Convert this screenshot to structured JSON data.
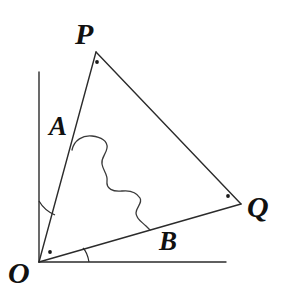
{
  "figure": {
    "background_color": "#ffffff",
    "stroke_color": "#2b2b2b",
    "label_color": "#111111",
    "labels": {
      "P": "P",
      "Q": "Q",
      "O": "O",
      "A": "A",
      "B": "B"
    },
    "points": {
      "O": {
        "x": 39,
        "y": 262
      },
      "P": {
        "x": 96,
        "y": 52
      },
      "Q": {
        "x": 241,
        "y": 204
      },
      "vertical_axis_top": {
        "x": 39,
        "y": 72
      },
      "horizontal_axis_right": {
        "x": 226,
        "y": 262
      }
    },
    "vertex_dots": [
      {
        "name": "dot-near-P",
        "x": 97,
        "y": 62,
        "r": 1.8
      },
      {
        "name": "dot-near-Q",
        "x": 228,
        "y": 196,
        "r": 1.8
      },
      {
        "name": "dot-near-O",
        "x": 50,
        "y": 252,
        "r": 1.8
      }
    ],
    "segments": [
      {
        "name": "vertical-ray",
        "x1": 39,
        "y1": 72,
        "x2": 39,
        "y2": 262
      },
      {
        "name": "horizontal-ray",
        "x1": 39,
        "y1": 262,
        "x2": 226,
        "y2": 262
      },
      {
        "name": "side-OP",
        "x1": 39,
        "y1": 262,
        "x2": 96,
        "y2": 52
      },
      {
        "name": "side-PQ",
        "x1": 96,
        "y1": 52,
        "x2": 241,
        "y2": 204
      },
      {
        "name": "side-OQ",
        "x1": 39,
        "y1": 262,
        "x2": 241,
        "y2": 204
      }
    ],
    "angle_arcs": [
      {
        "name": "angle-arc-A",
        "path": "M 39 203 A 60 60 0 0 0 55 210"
      },
      {
        "name": "angle-arc-B",
        "path": "M 88 262 A 50 50 0 0 0 84 249"
      }
    ],
    "region_curve": {
      "name": "irregular-region-boundary",
      "path": "M 72 150 C 74 141 83 136 92 137 C 100 138 107 141 107 147 C 107 154 101 157 102 163 C 103 170 107 173 107 180 C 107 188 113 191 121 191 C 130 191 136 192 139 197 C 142 202 136 206 136 212 C 136 218 141 221 145 225 C 147 227 148 228 149 229"
    }
  }
}
